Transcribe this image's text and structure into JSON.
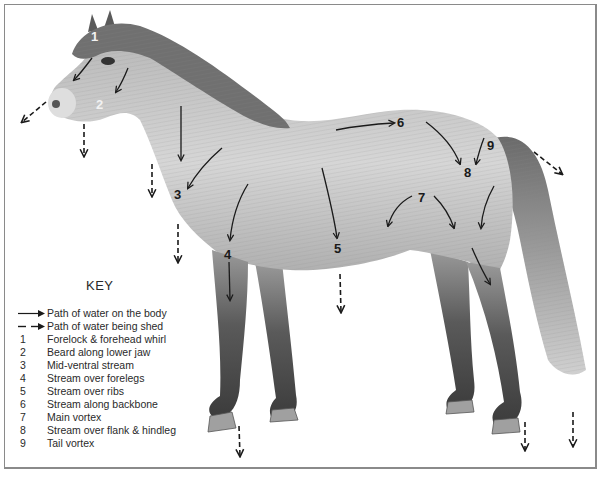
{
  "figure": {
    "colors": {
      "background": "#ffffff",
      "frame": "#8a8a8a",
      "arrow": "#1a1a1a",
      "coat_light": "#cfcfcf",
      "coat_mid": "#a8a8a8",
      "coat_dark": "#4a4a4a",
      "label_dark": "#1a1a1a",
      "label_light": "#f2f2f2"
    },
    "labels": [
      {
        "num": "1",
        "x": 91,
        "y": 30,
        "color": "light"
      },
      {
        "num": "2",
        "x": 96,
        "y": 98,
        "color": "light"
      },
      {
        "num": "3",
        "x": 174,
        "y": 188,
        "color": "dark"
      },
      {
        "num": "4",
        "x": 224,
        "y": 248,
        "color": "dark"
      },
      {
        "num": "5",
        "x": 334,
        "y": 242,
        "color": "dark"
      },
      {
        "num": "6",
        "x": 397,
        "y": 116,
        "color": "dark"
      },
      {
        "num": "7",
        "x": 418,
        "y": 191,
        "color": "dark"
      },
      {
        "num": "8",
        "x": 464,
        "y": 166,
        "color": "dark"
      },
      {
        "num": "9",
        "x": 487,
        "y": 139,
        "color": "dark"
      }
    ]
  },
  "key": {
    "title": "KEY",
    "legend": [
      {
        "style": "solid",
        "text": "Path of water on the body"
      },
      {
        "style": "dashed",
        "text": "Path of water being shed"
      }
    ],
    "items": [
      {
        "num": "1",
        "text": "Forelock & forehead whirl"
      },
      {
        "num": "2",
        "text": "Beard along lower jaw"
      },
      {
        "num": "3",
        "text": "Mid-ventral stream"
      },
      {
        "num": "4",
        "text": "Stream over forelegs"
      },
      {
        "num": "5",
        "text": "Stream over ribs"
      },
      {
        "num": "6",
        "text": "Stream along backbone"
      },
      {
        "num": "7",
        "text": "Main vortex"
      },
      {
        "num": "8",
        "text": "Stream over flank & hindleg"
      },
      {
        "num": "9",
        "text": "Tail vortex"
      }
    ]
  }
}
